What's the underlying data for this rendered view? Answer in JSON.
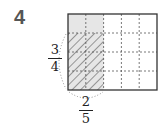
{
  "problem": {
    "number": "4"
  },
  "diagram": {
    "grid": {
      "columns": 5,
      "rows": 4
    },
    "shaded_columns": 2,
    "hatched_rows": 3,
    "colors": {
      "shade": "#e6e6e6",
      "border": "#333333",
      "dash": "#555555",
      "hatch": "#444444"
    }
  },
  "fractions": {
    "vertical": {
      "numerator": "3",
      "denominator": "4"
    },
    "horizontal": {
      "numerator": "2",
      "denominator": "5"
    }
  }
}
